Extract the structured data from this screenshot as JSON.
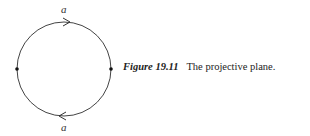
{
  "diagram": {
    "shape": "circle",
    "center": [
      64,
      69
    ],
    "radius": 47,
    "stroke_color": "#444444",
    "vertices": [
      {
        "name": "left-vertex",
        "x": 17,
        "y": 69
      },
      {
        "name": "right-vertex",
        "x": 111,
        "y": 69
      }
    ],
    "edges": [
      {
        "name": "top-edge",
        "label": "a",
        "arrow_direction": "right"
      },
      {
        "name": "bottom-edge",
        "label": "a",
        "arrow_direction": "left"
      }
    ]
  },
  "caption": {
    "label": "Figure 19.11",
    "text": "The projective plane."
  }
}
